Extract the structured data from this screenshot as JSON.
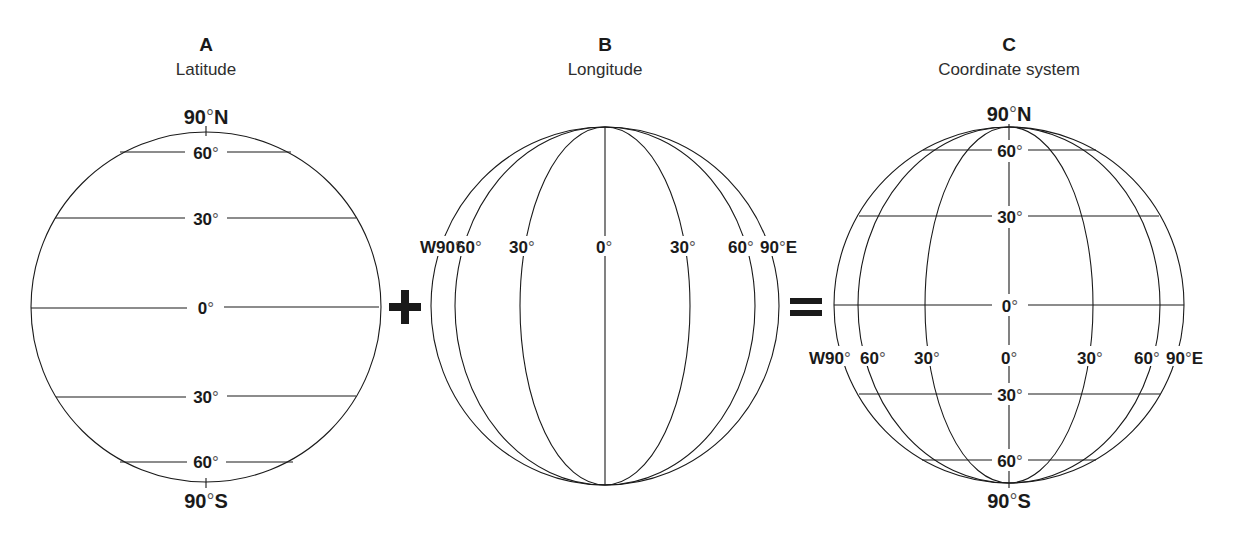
{
  "panels": [
    {
      "letter": "A",
      "title": "Latitude",
      "north_label": "90°N",
      "south_label": "90°S",
      "latitude_labels": [
        "60°",
        "30°",
        "0°",
        "30°",
        "60°"
      ]
    },
    {
      "letter": "B",
      "title": "Longitude",
      "longitude_labels": [
        "W90°",
        "60°",
        "30°",
        "0°",
        "30°",
        "60°",
        "90°E"
      ]
    },
    {
      "letter": "C",
      "title": "Coordinate system",
      "north_label": "90°N",
      "south_label": "90°S",
      "latitude_labels": [
        "60°",
        "30°",
        "0°",
        "30°",
        "60°"
      ],
      "longitude_labels": [
        "W90°",
        "60°",
        "30°",
        "0°",
        "30°",
        "60°",
        "90°E"
      ]
    }
  ],
  "operators": {
    "plus": "+",
    "equals": "="
  },
  "parts": {
    "deg": "°",
    "lat": [
      "60",
      "30",
      "0",
      "30",
      "60"
    ],
    "lon": [
      "W90",
      "60",
      "30",
      "0",
      "30",
      "60",
      "90"
    ],
    "east_suffix": "E",
    "north_num": "90",
    "north_suffix": "N",
    "south_num": "90",
    "south_suffix": "S"
  }
}
